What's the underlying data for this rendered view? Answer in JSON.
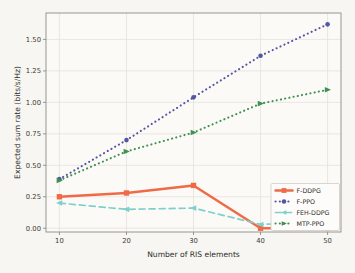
{
  "figure": {
    "background": "#f7f6f2",
    "plot_background": "#fbfaf7",
    "spine_color": "#8d8c86",
    "grid_color": "#e4e2dc",
    "legend_border_color": "#cfcdc6",
    "legend_background": "#fdfcfa"
  },
  "chart_data": {
    "type": "line",
    "title": "",
    "xlabel": "Number of RIS elements",
    "ylabel": "Expected sum rate (bits/s/Hz)",
    "grid": true,
    "legend_position": "lower right",
    "x": [
      10,
      20,
      30,
      40,
      50
    ],
    "xticks": [
      10,
      20,
      30,
      40,
      50
    ],
    "xtick_labels": [
      "10",
      "20",
      "30",
      "40",
      "50"
    ],
    "yticks": [
      0,
      0.25,
      0.5,
      0.75,
      1.0,
      1.25,
      1.5
    ],
    "ytick_labels": [
      "0.00",
      "0.25",
      "0.50",
      "0.75",
      "1.00",
      "1.25",
      "1.50"
    ],
    "xlim": [
      8,
      52
    ],
    "ylim": [
      -0.03,
      1.71
    ],
    "series": [
      {
        "name": "F-DDPG",
        "color": "#ef6a47",
        "line_style": "solid",
        "marker": "square",
        "values": [
          0.25,
          0.28,
          0.34,
          0.0,
          0.0
        ]
      },
      {
        "name": "F-PPO",
        "color": "#5456a2",
        "line_style": "dotted",
        "marker": "circle",
        "values": [
          0.39,
          0.7,
          1.04,
          1.37,
          1.62
        ]
      },
      {
        "name": "FEH-DDPG",
        "color": "#7fd0cb",
        "line_style": "dashed",
        "marker": "tri-left",
        "values": [
          0.2,
          0.15,
          0.16,
          0.03,
          0.05
        ]
      },
      {
        "name": "MTP-PPO",
        "color": "#3f9150",
        "line_style": "dotted",
        "marker": "tri-right",
        "values": [
          0.38,
          0.61,
          0.76,
          0.99,
          1.1
        ]
      }
    ]
  }
}
